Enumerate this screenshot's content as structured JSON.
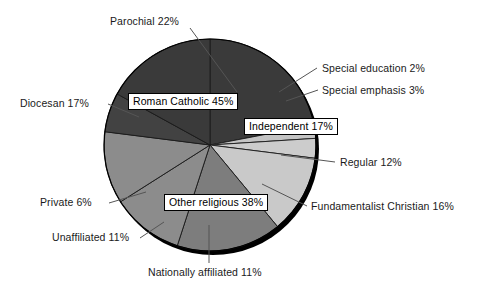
{
  "chart_data": {
    "type": "pie",
    "title": "",
    "subtitle": "",
    "xlabel": "",
    "ylabel": "",
    "grid": false,
    "legend_position": "none",
    "total_percent": 100,
    "groups": [
      {
        "name": "Roman Catholic",
        "label": "Roman Catholic 45%",
        "value": 45,
        "color": "#3a3a3a",
        "boxed": true,
        "members": [
          "Parochial",
          "Diocesan",
          "Private"
        ]
      },
      {
        "name": "Independent",
        "label": "Independent 17%",
        "value": 17,
        "color": "#c9c9c9",
        "boxed": true,
        "members": [
          "Special education",
          "Special emphasis",
          "Regular"
        ]
      },
      {
        "name": "Other religious",
        "label": "Other religious 38%",
        "value": 38,
        "color": "#8a8a8a",
        "boxed": true,
        "members": [
          "Fundamentalist Christian",
          "Nationally affiliated",
          "Unaffiliated"
        ]
      }
    ],
    "slices": [
      {
        "label": "Parochial 22%",
        "name": "Parochial",
        "value": 22,
        "color": "#3a3a3a",
        "group": "Roman Catholic"
      },
      {
        "label": "Special education 2%",
        "name": "Special education",
        "value": 2,
        "color": "#c4c4c4",
        "group": "Independent"
      },
      {
        "label": "Special emphasis 3%",
        "name": "Special emphasis",
        "value": 3,
        "color": "#cccccc",
        "group": "Independent"
      },
      {
        "label": "Regular 12%",
        "name": "Regular",
        "value": 12,
        "color": "#c9c9c9",
        "group": "Independent"
      },
      {
        "label": "Fundamentalist Christian 16%",
        "name": "Fundamentalist Christian",
        "value": 16,
        "color": "#7d7d7d",
        "group": "Other religious"
      },
      {
        "label": "Nationally affiliated 11%",
        "name": "Nationally affiliated",
        "value": 11,
        "color": "#8c8c8c",
        "group": "Other religious"
      },
      {
        "label": "Unaffiliated 11%",
        "name": "Unaffiliated",
        "value": 11,
        "color": "#8c8c8c",
        "group": "Other religious"
      },
      {
        "label": "Private 6%",
        "name": "Private",
        "value": 6,
        "color": "#424242",
        "group": "Roman Catholic"
      },
      {
        "label": "Diocesan 17%",
        "name": "Diocesan",
        "value": 17,
        "color": "#3a3a3a",
        "group": "Roman Catholic"
      }
    ],
    "colors": {
      "roman_catholic": "#3a3a3a",
      "independent": "#c9c9c9",
      "other_religious": "#8a8a8a",
      "shadow": "#000000",
      "outline": "#000000",
      "text": "#1a1a1a",
      "background": "#ffffff"
    }
  },
  "labels": {
    "parochial": "Parochial 22%",
    "diocesan": "Diocesan 17%",
    "private": "Private 6%",
    "unaffiliated": "Unaffiliated 11%",
    "nationally_affiliated": "Nationally affiliated 11%",
    "fundamentalist_christian": "Fundamentalist Christian 16%",
    "regular": "Regular 12%",
    "special_emphasis": "Special emphasis 3%",
    "special_education": "Special education 2%",
    "roman_catholic_box": "Roman Catholic 45%",
    "independent_box": "Independent 17%",
    "other_religious_box": "Other religious 38%"
  }
}
